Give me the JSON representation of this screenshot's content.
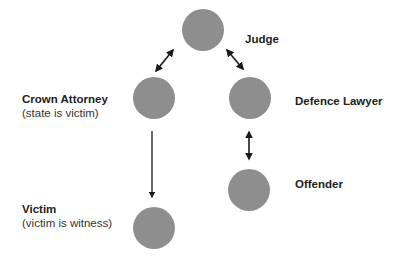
{
  "diagram": {
    "colors": {
      "node": "#8e8e8e",
      "arrow": "#1a1a1a",
      "text": "#222222"
    },
    "nodes": [
      {
        "id": "judge",
        "title": "Judge",
        "subtitle": ""
      },
      {
        "id": "crown",
        "title": "Crown Attorney",
        "subtitle": "(state is victim)"
      },
      {
        "id": "defence",
        "title": "Defence Lawyer",
        "subtitle": ""
      },
      {
        "id": "offender",
        "title": "Offender",
        "subtitle": ""
      },
      {
        "id": "victim",
        "title": "Victim",
        "subtitle": "(victim is witness)"
      }
    ],
    "edges": [
      {
        "from": "crown",
        "to": "judge",
        "type": "bidirectional"
      },
      {
        "from": "judge",
        "to": "defence",
        "type": "bidirectional"
      },
      {
        "from": "crown",
        "to": "victim",
        "type": "directed"
      },
      {
        "from": "defence",
        "to": "offender",
        "type": "bidirectional"
      }
    ]
  }
}
